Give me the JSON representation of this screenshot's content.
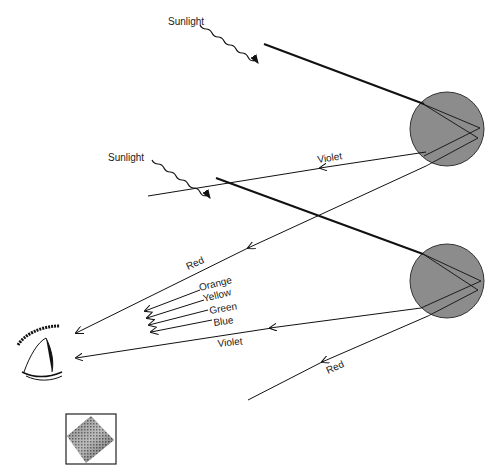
{
  "diagram": {
    "labels": {
      "sunlight_top": "Sunlight",
      "sunlight_mid": "Sunlight",
      "violet_upper": "Violet",
      "red_upper": "Red",
      "orange": "Orange",
      "yellow": "Yellow",
      "green": "Green",
      "blue": "Blue",
      "violet_lower": "Violet",
      "red_lower": "Red"
    },
    "colors": {
      "drop_fill": "#8c8c8c",
      "line": "#111111",
      "background": "#ffffff"
    },
    "elements": {
      "raindrops": 2,
      "observer": "eye",
      "inset": "dithered diamond icon"
    }
  }
}
